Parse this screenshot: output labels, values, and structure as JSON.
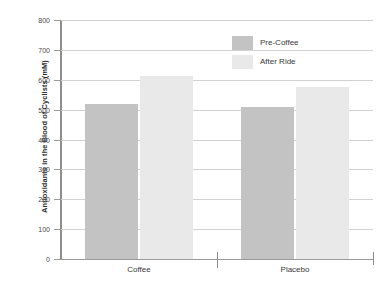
{
  "chart_data": {
    "type": "bar",
    "title": "",
    "xlabel": "",
    "ylabel": "Antioxidants in the Blood of Cyclists (mM)",
    "categories": [
      "Coffee",
      "Placebo"
    ],
    "series": [
      {
        "name": "Pre-Coffee",
        "color": "#c3c3c3",
        "values": [
          518,
          508
        ]
      },
      {
        "name": "After Ride",
        "color": "#e9e9e9",
        "values": [
          612,
          575
        ]
      }
    ],
    "ylim": [
      0,
      800
    ],
    "ytick_step": 100,
    "yticks": [
      0,
      100,
      200,
      300,
      400,
      500,
      600,
      700,
      800
    ],
    "ytick_labels": [
      "0",
      "100",
      "200",
      "300",
      "400",
      "500",
      "600",
      "700",
      "800"
    ],
    "grid": true,
    "legend_position": "top-center-right"
  },
  "legend": {
    "items": [
      {
        "label": "Pre-Coffee",
        "color": "#c3c3c3"
      },
      {
        "label": "After Ride",
        "color": "#e9e9e9"
      }
    ]
  },
  "axes": {
    "y_title": "Antioxidants in the Blood of Cyclists (mM)",
    "x_categories": [
      "Coffee",
      "Placebo"
    ]
  }
}
